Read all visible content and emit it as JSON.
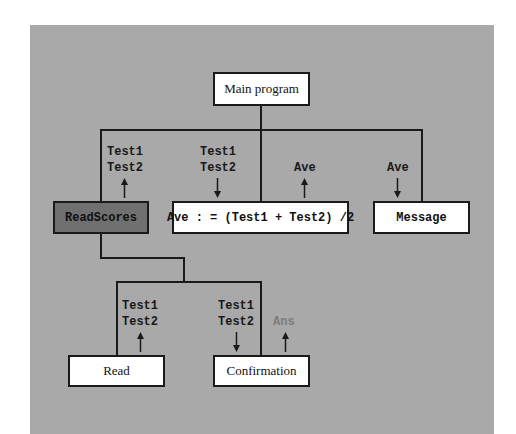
{
  "diagram": {
    "type": "structure-chart",
    "colors": {
      "background": "#ffffff",
      "panel": "#a9a9a9",
      "box_fill": "#ffffff",
      "highlight_box_fill": "#707070",
      "line": "#1a1a1a",
      "muted_label": "#7c7c7c"
    },
    "nodes": {
      "main": {
        "label": "Main program"
      },
      "readscores": {
        "label": "ReadScores",
        "highlighted": true
      },
      "average": {
        "label": "Ave : = (Test1 + Test2) /2"
      },
      "message": {
        "label": "Message"
      },
      "read": {
        "label": "Read"
      },
      "confirmation": {
        "label": "Confirmation"
      }
    },
    "flows": {
      "readscores_out": {
        "line1": "Test1",
        "line2": "Test2",
        "direction": "up"
      },
      "average_in": {
        "line1": "Test1",
        "line2": "Test2",
        "direction": "down"
      },
      "average_out": {
        "line1": "Ave",
        "direction": "up"
      },
      "message_in": {
        "line1": "Ave",
        "direction": "down"
      },
      "read_out": {
        "line1": "Test1",
        "line2": "Test2",
        "direction": "up"
      },
      "confirmation_in": {
        "line1": "Test1",
        "line2": "Test2",
        "direction": "down"
      },
      "confirmation_out": {
        "line1": "Ans",
        "direction": "up"
      }
    },
    "edges": [
      [
        "main",
        "readscores"
      ],
      [
        "main",
        "average"
      ],
      [
        "main",
        "message"
      ],
      [
        "readscores",
        "read"
      ],
      [
        "readscores",
        "confirmation"
      ]
    ]
  }
}
